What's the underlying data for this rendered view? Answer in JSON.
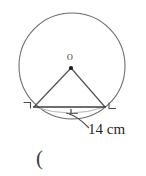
{
  "figure": {
    "type": "geometry-diagram",
    "background_color": "#ffffff",
    "stroke_color": "#555555",
    "text_color": "#262626",
    "center_label": "O",
    "measurement_label": "14 cm",
    "trailing_text": "(",
    "circle": {
      "center_x": 72,
      "center_y": 66,
      "radius": 53,
      "stroke": "#666666",
      "fill": "none"
    },
    "center_point": {
      "x": 71,
      "y": 68,
      "radius": 2,
      "fill": "#1a1a1a"
    },
    "chord": {
      "x1": 34,
      "y1": 107,
      "x2": 105,
      "y2": 107,
      "length_text": "14 cm",
      "stroke": "#4a4a4a"
    },
    "triangle_legs": [
      {
        "name": "left-radius",
        "x1": 71,
        "y1": 68,
        "x2": 34,
        "y2": 107
      },
      {
        "name": "right-radius",
        "x1": 71,
        "y1": 68,
        "x2": 105,
        "y2": 107
      }
    ],
    "segment_arc": {
      "name": "lower-arc-highlight",
      "stroke": "#a8a8a8"
    },
    "corner_marks": [
      {
        "name": "left-corner-mark",
        "x": 25,
        "y": 104
      },
      {
        "name": "right-corner-mark",
        "x": 108,
        "y": 104
      }
    ],
    "tick_mark": {
      "name": "chord-midpoint-tick",
      "x": 71,
      "y": 112
    },
    "leader_line": {
      "name": "measurement-leader",
      "from_x": 71,
      "from_y": 114,
      "to_x": 88,
      "to_y": 129
    }
  }
}
